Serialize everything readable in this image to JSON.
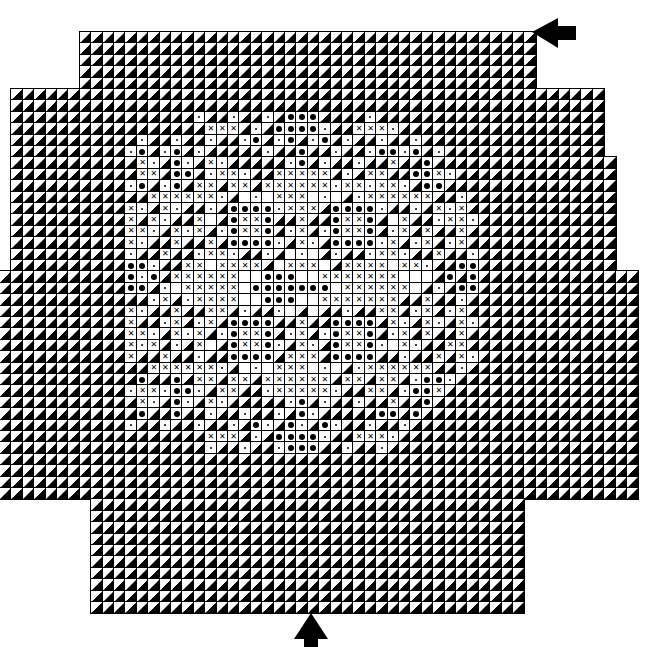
{
  "chart": {
    "type": "stitch-pattern-chart",
    "cell_size_px": 11.4,
    "origin": {
      "x": 0,
      "y": 32
    },
    "rows": 51,
    "legend_symbols": {
      "background": "diagonal half black/white triangle",
      "w": "blank white square",
      ".": "small dot",
      "o": "filled circle",
      "x": "cross"
    },
    "outline": [
      {
        "rows": [
          0,
          4
        ],
        "cols": [
          7,
          46
        ]
      },
      {
        "rows": [
          5,
          10
        ],
        "cols": [
          1,
          52
        ]
      },
      {
        "rows": [
          11,
          20
        ],
        "cols": [
          1,
          53
        ]
      },
      {
        "rows": [
          21,
          40
        ],
        "cols": [
          0,
          55
        ]
      },
      {
        "rows": [
          41,
          50
        ],
        "cols": [
          8,
          45
        ]
      }
    ],
    "motif_origin": {
      "col": 11,
      "row": 7
    },
    "motif": [
      "..............ooo..............",
      ".......xxx...oooo...xxx........",
      "...........o..o..o.............",
      ".o..o..........o......oo.o.....",
      ".x..o..x.......o.......x..o....",
      ".xx.oo..xx...xxxxx...xx..oox...",
      ".o..o.xx.xx.xxxxxx.xx.xx..oo...",
      "..xxxxxx..w.wxxxw.w..xxxxxx....",
      "x..x.....oooo.xxx.oooo.....x.x.",
      "x.x...xw.oxxo..x..oxxo.wx...xx.",
      "xx..x.x..oxxo..x..oxxo..x.x..x.",
      "x...x..x.oooo..x..oooo.x..x..x.",
      "...x...xx.....w.w.....xx...x...",
      "oo...xxwxxxx.wxxxw.xxxxwxx...oo",
      "o.o.xxxxxxwwooowwxxxxxxxwww.o.o",
      "oo..wxxxxxwooooooowxxxxxxw...oo",
      "...x..xxxxwwooowwxxxxxxx..x....",
      "x...x..xx.....w.w.....xx..x..x.",
      "x...x..x.oooo..x..oooo.x..x..x.",
      "xx..x.x..oxxo..x..oxxo..x.x..x.",
      "x.x...xw.oxxo..x..oxxo.wx...xx.",
      "x..x.....oooo.xxx.oooo.....x.x.",
      "..xxxxxx..w.wxxxw.w..xxxxxx....",
      ".o..o.xx.xx.xxxxxx.xx.xx..oo...",
      ".xx.oo..xx...xxxxx...xx..oox...",
      ".x..o..x.......o.......x..o....",
      ".o..o..........o......oo.o.....",
      "...........o..o..o.............",
      ".......xxx...oooo...xxx........",
      "..............ooo.............."
    ]
  },
  "markers": {
    "top_right_arrow": {
      "direction": "left",
      "x": 534,
      "y": 22
    },
    "bottom_arrow": {
      "direction": "up",
      "x": 295,
      "y": 612
    }
  }
}
